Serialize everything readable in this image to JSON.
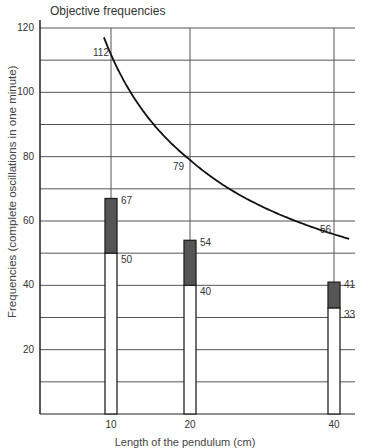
{
  "chart_data": {
    "type": "bar",
    "title": "Objective frequencies",
    "xlabel": "Length of the pendulum (cm)",
    "ylabel": "Frequencies (complete oscillations in one minute)",
    "ylim": [
      0,
      120
    ],
    "grid": true,
    "y_ticks": [
      20,
      40,
      60,
      80,
      100,
      120
    ],
    "x_ticks": [
      10,
      20,
      40
    ],
    "categories": [
      "10",
      "20",
      "40"
    ],
    "series": [
      {
        "name": "Lower value (white bar)",
        "values": [
          50,
          40,
          33
        ]
      },
      {
        "name": "Upper value (dark bar top)",
        "values": [
          67,
          54,
          41
        ]
      }
    ],
    "curve": {
      "name": "Objective frequency curve",
      "type": "line",
      "points": [
        {
          "x": 10,
          "y": 112
        },
        {
          "x": 20,
          "y": 79
        },
        {
          "x": 40,
          "y": 56
        }
      ]
    },
    "annotations": [
      "112",
      "79",
      "56",
      "67",
      "50",
      "54",
      "40",
      "41",
      "33"
    ]
  },
  "colors": {
    "axis": "#222222",
    "grid": "#555555",
    "bar_dark": "#555555",
    "bar_light": "#ffffff",
    "curve": "#111111",
    "label_79": "#3a3a7a"
  }
}
